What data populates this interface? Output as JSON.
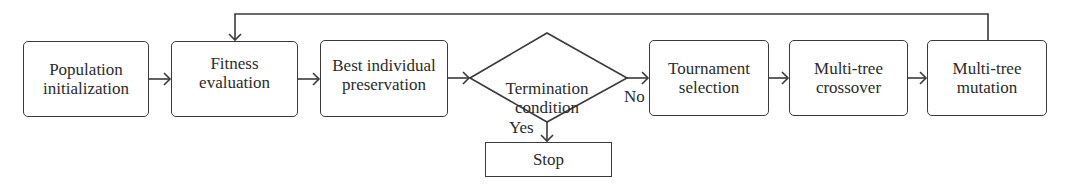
{
  "diagram": {
    "type": "flowchart",
    "nodes": {
      "population": "Population\ninitialization",
      "fitness": "Fitness\nevaluation",
      "best": "Best individual\npreservation",
      "termination": "Termination\ncondition",
      "tournament": "Tournament\nselection",
      "crossover": "Multi-tree\ncrossover",
      "mutation": "Multi-tree\nmutation",
      "stop": "Stop"
    },
    "edge_labels": {
      "no": "No",
      "yes": "Yes"
    },
    "edges": [
      {
        "from": "population",
        "to": "fitness"
      },
      {
        "from": "fitness",
        "to": "best"
      },
      {
        "from": "best",
        "to": "termination"
      },
      {
        "from": "termination",
        "to": "tournament",
        "label": "No"
      },
      {
        "from": "termination",
        "to": "stop",
        "label": "Yes"
      },
      {
        "from": "tournament",
        "to": "crossover"
      },
      {
        "from": "crossover",
        "to": "mutation"
      },
      {
        "from": "mutation",
        "to": "fitness"
      }
    ],
    "colors": {
      "stroke": "#3a3a3a",
      "text": "#2b2b2b",
      "background": "#ffffff"
    }
  }
}
